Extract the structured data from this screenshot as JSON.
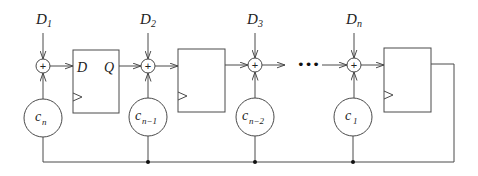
{
  "diagram": {
    "type": "LFSR / polynomial-multiplication shift register with adders and feedback coefficients",
    "inputs": [
      {
        "base": "D",
        "sub": "1"
      },
      {
        "base": "D",
        "sub": "2"
      },
      {
        "base": "D",
        "sub": "3"
      },
      {
        "base": "D",
        "sub": "n"
      }
    ],
    "adders": [
      {
        "symbol": "+"
      },
      {
        "symbol": "+"
      },
      {
        "symbol": "+"
      },
      {
        "symbol": "+"
      }
    ],
    "flip_flops": [
      {
        "d_label": "D",
        "q_label": "Q"
      },
      {
        "d_label": "",
        "q_label": ""
      },
      {
        "d_label": "",
        "q_label": ""
      }
    ],
    "coefficients": [
      {
        "base": "c",
        "sub": "n"
      },
      {
        "base": "c",
        "sub": "n−1"
      },
      {
        "base": "c",
        "sub": "n−2"
      },
      {
        "base": "c",
        "sub": "1"
      }
    ],
    "ellipsis": "•••",
    "colors": {
      "line": "#4a4a4a",
      "text": "#222222",
      "background": "#ffffff"
    }
  }
}
